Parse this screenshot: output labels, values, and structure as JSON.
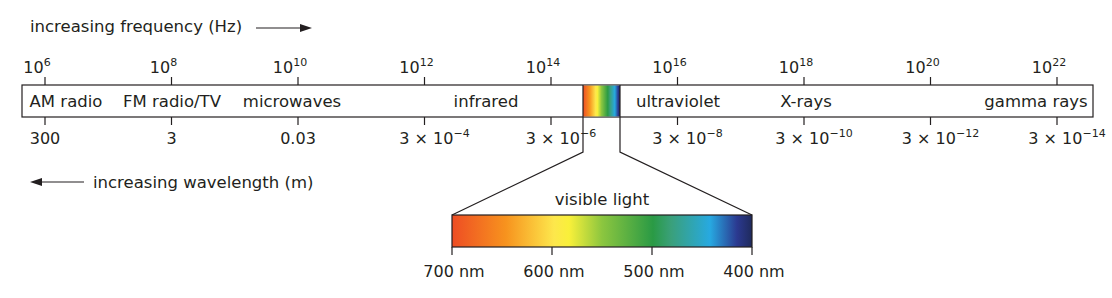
{
  "title_freq": "increasing frequency (Hz)",
  "title_wave": "increasing wavelength (m)",
  "frequency_ticks": [
    {
      "base": "10",
      "exp": "6"
    },
    {
      "base": "10",
      "exp": "8"
    },
    {
      "base": "10",
      "exp": "10"
    },
    {
      "base": "10",
      "exp": "12"
    },
    {
      "base": "10",
      "exp": "14"
    },
    {
      "base": "10",
      "exp": "16"
    },
    {
      "base": "10",
      "exp": "18"
    },
    {
      "base": "10",
      "exp": "20"
    },
    {
      "base": "10",
      "exp": "22"
    }
  ],
  "wavelength_ticks": [
    {
      "base": "300",
      "exp": ""
    },
    {
      "base": "3",
      "exp": ""
    },
    {
      "base": "0.03",
      "exp": ""
    },
    {
      "base": "3 × 10",
      "exp": "−4"
    },
    {
      "base": "3 × 10",
      "exp": "−6"
    },
    {
      "base": "3 × 10",
      "exp": "−8"
    },
    {
      "base": "3 × 10",
      "exp": "−10"
    },
    {
      "base": "3 × 10",
      "exp": "−12"
    },
    {
      "base": "3 × 10",
      "exp": "−14"
    }
  ],
  "bands": [
    "AM radio",
    "FM radio/TV",
    "microwaves",
    "infrared",
    "ultraviolet",
    "X-rays",
    "gamma rays"
  ],
  "visible": {
    "label": "visible light",
    "ticks": [
      "700 nm",
      "600 nm",
      "500 nm",
      "400 nm"
    ],
    "colors": [
      "#ee4d24",
      "#f7931e",
      "#fde74c",
      "#f9f03a",
      "#8cc63f",
      "#2a9a45",
      "#1f8f5a",
      "#27a9e1",
      "#2b3990",
      "#1f2a5c"
    ]
  }
}
